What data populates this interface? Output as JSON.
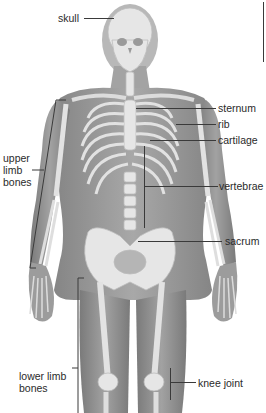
{
  "diagram": {
    "labels": {
      "skull": "skull",
      "sternum": "sternum",
      "rib": "rib",
      "cartilage": "cartilage",
      "vertebrae": "vertebrae",
      "sacrum": "sacrum",
      "upper_limb_line1": "upper",
      "upper_limb_line2": "limb",
      "upper_limb_line3": "bones",
      "lower_limb_line1": "lower limb",
      "lower_limb_line2": "bones",
      "knee_joint": "knee joint"
    },
    "colors": {
      "body": "#9a9a9a",
      "body_dark": "#7d7d7d",
      "bone": "#e6e6e6",
      "bone_shadow": "#c4c4c4",
      "leader": "#3a3a3a",
      "text": "#2a2a2a"
    }
  }
}
